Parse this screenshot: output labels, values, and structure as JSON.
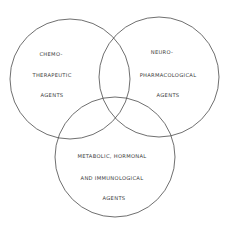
{
  "diagram": {
    "type": "venn",
    "stroke_color": "#4a4a4a",
    "background": "#ffffff",
    "sets": [
      {
        "id": "chemotherapeutic",
        "lines": [
          "CHEMO-",
          "THERAPEUTIC",
          "AGENTS"
        ]
      },
      {
        "id": "neuropharmacological",
        "lines": [
          "NEURO-",
          "PHARMACOLOGICAL",
          "AGENTS"
        ]
      },
      {
        "id": "metabolic",
        "lines": [
          "METABOLIC, HORMONAL",
          "AND  IMMUNOLOGICAL",
          "AGENTS"
        ]
      }
    ]
  }
}
